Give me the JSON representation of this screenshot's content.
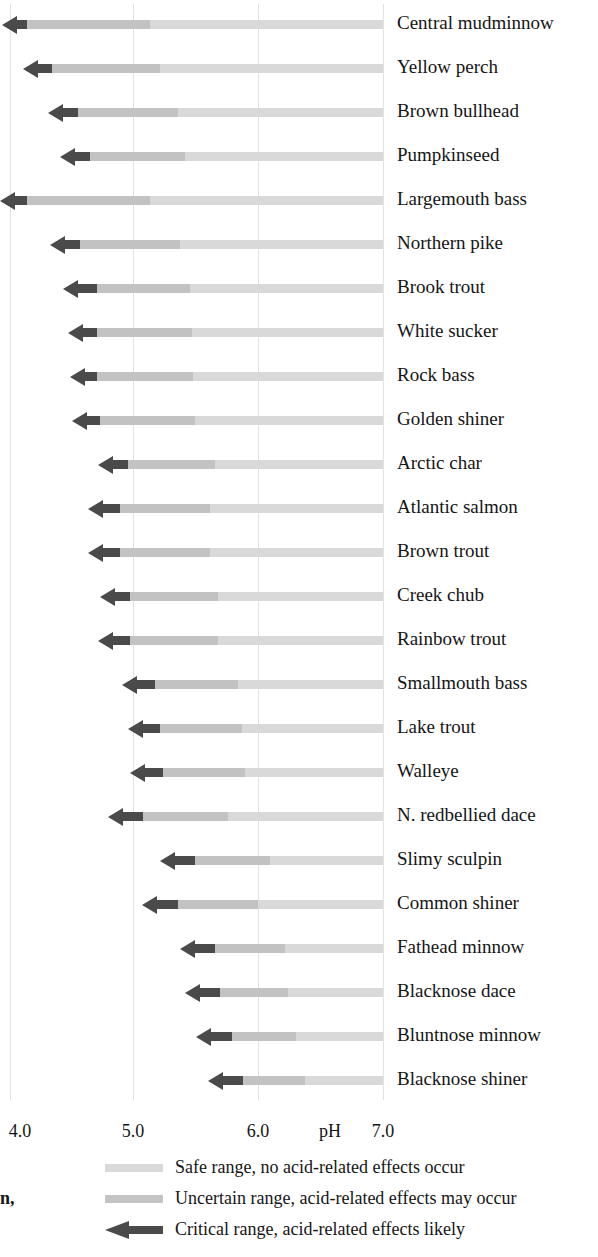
{
  "chart_data": {
    "type": "bar",
    "title": "",
    "xlabel": "pH",
    "ylabel": "",
    "xlim": [
      3.8,
      7.0
    ],
    "grid": true,
    "orientation": "horizontal",
    "legend_position": "bottom",
    "axis": {
      "ticks": [
        {
          "label": "4.0",
          "value": 4.0,
          "x": 20
        },
        {
          "label": "5.0",
          "value": 5.0,
          "x": 133
        },
        {
          "label": "6.0",
          "value": 6.0,
          "x": 258
        },
        {
          "label": "7.0",
          "value": 7.0,
          "x": 383
        }
      ],
      "title": "pH",
      "title_x": 330
    },
    "gridlines_x": [
      10,
      133,
      258,
      383
    ],
    "segments": [
      {
        "key": "critical",
        "label": "Critical range, acid-related effects likely",
        "color": "#4a4a4a"
      },
      {
        "key": "uncertain",
        "label": "Uncertain range, acid-related effects may occur",
        "color": "#c2c2c2"
      },
      {
        "key": "safe",
        "label": "Safe range, no acid-related effects occur",
        "color": "#d9d9d9"
      }
    ],
    "categories": [
      "Central mudminnow",
      "Yellow perch",
      "Brown bullhead",
      "Pumpkinseed",
      "Largemouth bass",
      "Northern pike",
      "Brook trout",
      "White sucker",
      "Rock bass",
      "Golden shiner",
      "Arctic char",
      "Atlantic salmon",
      "Brown trout",
      "Creek chub",
      "Rainbow trout",
      "Smallmouth bass",
      "Lake trout",
      "Walleye",
      "N. redbellied dace",
      "Slimy sculpin",
      "Common shiner",
      "Fathead minnow",
      "Blacknose dace",
      "Bluntnose minnow",
      "Blacknose shiner"
    ],
    "rows": [
      {
        "species": "Central mudminnow",
        "critical_start_px": 2,
        "critical_end_px": 27,
        "uncertain_end_px": 150,
        "safe_end_px": 383,
        "critical_ph_max": 4.2,
        "uncertain_ph_max": 5.1,
        "safe_ph_max": 7.0
      },
      {
        "species": "Yellow perch",
        "critical_start_px": 23,
        "critical_end_px": 52,
        "uncertain_end_px": 160,
        "safe_end_px": 383,
        "critical_ph_max": 4.4,
        "uncertain_ph_max": 5.2,
        "safe_ph_max": 7.0
      },
      {
        "species": "Brown bullhead",
        "critical_start_px": 48,
        "critical_end_px": 78,
        "uncertain_end_px": 178,
        "safe_end_px": 383,
        "critical_ph_max": 4.6,
        "uncertain_ph_max": 5.4,
        "safe_ph_max": 7.0
      },
      {
        "species": "Pumpkinseed",
        "critical_start_px": 60,
        "critical_end_px": 90,
        "uncertain_end_px": 185,
        "safe_end_px": 383,
        "critical_ph_max": 4.7,
        "uncertain_ph_max": 5.4,
        "safe_ph_max": 7.0
      },
      {
        "species": "Largemouth bass",
        "critical_start_px": 0,
        "critical_end_px": 27,
        "uncertain_end_px": 150,
        "safe_end_px": 383,
        "critical_ph_max": 4.2,
        "uncertain_ph_max": 5.1,
        "safe_ph_max": 7.0
      },
      {
        "species": "Northern pike",
        "critical_start_px": 50,
        "critical_end_px": 80,
        "uncertain_end_px": 180,
        "safe_end_px": 383,
        "critical_ph_max": 4.6,
        "uncertain_ph_max": 5.4,
        "safe_ph_max": 7.0
      },
      {
        "species": "Brook trout",
        "critical_start_px": 63,
        "critical_end_px": 97,
        "uncertain_end_px": 190,
        "safe_end_px": 383,
        "critical_ph_max": 4.8,
        "uncertain_ph_max": 5.5,
        "safe_ph_max": 7.0
      },
      {
        "species": "White sucker",
        "critical_start_px": 68,
        "critical_end_px": 97,
        "uncertain_end_px": 192,
        "safe_end_px": 383,
        "critical_ph_max": 4.8,
        "uncertain_ph_max": 5.5,
        "safe_ph_max": 7.0
      },
      {
        "species": "Rock bass",
        "critical_start_px": 70,
        "critical_end_px": 97,
        "uncertain_end_px": 193,
        "safe_end_px": 383,
        "critical_ph_max": 4.8,
        "uncertain_ph_max": 5.5,
        "safe_ph_max": 7.0
      },
      {
        "species": "Golden shiner",
        "critical_start_px": 72,
        "critical_end_px": 100,
        "uncertain_end_px": 195,
        "safe_end_px": 383,
        "critical_ph_max": 4.8,
        "uncertain_ph_max": 5.5,
        "safe_ph_max": 7.0
      },
      {
        "species": "Arctic char",
        "critical_start_px": 98,
        "critical_end_px": 128,
        "uncertain_end_px": 215,
        "safe_end_px": 383,
        "critical_ph_max": 5.0,
        "uncertain_ph_max": 5.7,
        "safe_ph_max": 7.0
      },
      {
        "species": "Atlantic salmon",
        "critical_start_px": 88,
        "critical_end_px": 120,
        "uncertain_end_px": 210,
        "safe_end_px": 383,
        "critical_ph_max": 4.9,
        "uncertain_ph_max": 5.6,
        "safe_ph_max": 7.0
      },
      {
        "species": "Brown trout",
        "critical_start_px": 88,
        "critical_end_px": 120,
        "uncertain_end_px": 210,
        "safe_end_px": 383,
        "critical_ph_max": 4.9,
        "uncertain_ph_max": 5.6,
        "safe_ph_max": 7.0
      },
      {
        "species": "Creek chub",
        "critical_start_px": 100,
        "critical_end_px": 130,
        "uncertain_end_px": 218,
        "safe_end_px": 383,
        "critical_ph_max": 5.0,
        "uncertain_ph_max": 5.7,
        "safe_ph_max": 7.0
      },
      {
        "species": "Rainbow trout",
        "critical_start_px": 98,
        "critical_end_px": 130,
        "uncertain_end_px": 218,
        "safe_end_px": 383,
        "critical_ph_max": 5.0,
        "uncertain_ph_max": 5.7,
        "safe_ph_max": 7.0
      },
      {
        "species": "Smallmouth bass",
        "critical_start_px": 122,
        "critical_end_px": 155,
        "uncertain_end_px": 238,
        "safe_end_px": 383,
        "critical_ph_max": 5.2,
        "uncertain_ph_max": 5.9,
        "safe_ph_max": 7.0
      },
      {
        "species": "Lake trout",
        "critical_start_px": 128,
        "critical_end_px": 160,
        "uncertain_end_px": 242,
        "safe_end_px": 383,
        "critical_ph_max": 5.2,
        "uncertain_ph_max": 5.9,
        "safe_ph_max": 7.0
      },
      {
        "species": "Walleye",
        "critical_start_px": 130,
        "critical_end_px": 163,
        "uncertain_end_px": 245,
        "safe_end_px": 383,
        "critical_ph_max": 5.3,
        "uncertain_ph_max": 5.9,
        "safe_ph_max": 7.0
      },
      {
        "species": "N. redbellied dace",
        "critical_start_px": 108,
        "critical_end_px": 143,
        "uncertain_end_px": 228,
        "safe_end_px": 383,
        "critical_ph_max": 5.1,
        "uncertain_ph_max": 5.8,
        "safe_ph_max": 7.0
      },
      {
        "species": "Slimy sculpin",
        "critical_start_px": 160,
        "critical_end_px": 195,
        "uncertain_end_px": 270,
        "safe_end_px": 383,
        "critical_ph_max": 5.5,
        "uncertain_ph_max": 6.1,
        "safe_ph_max": 7.0
      },
      {
        "species": "Common shiner",
        "critical_start_px": 142,
        "critical_end_px": 178,
        "uncertain_end_px": 258,
        "safe_end_px": 383,
        "critical_ph_max": 5.4,
        "uncertain_ph_max": 6.0,
        "safe_ph_max": 7.0
      },
      {
        "species": "Fathead minnow",
        "critical_start_px": 180,
        "critical_end_px": 215,
        "uncertain_end_px": 285,
        "safe_end_px": 383,
        "critical_ph_max": 5.7,
        "uncertain_ph_max": 6.2,
        "safe_ph_max": 7.0
      },
      {
        "species": "Blacknose dace",
        "critical_start_px": 185,
        "critical_end_px": 220,
        "uncertain_end_px": 288,
        "safe_end_px": 383,
        "critical_ph_max": 5.7,
        "uncertain_ph_max": 6.2,
        "safe_ph_max": 7.0
      },
      {
        "species": "Bluntnose minnow",
        "critical_start_px": 196,
        "critical_end_px": 232,
        "uncertain_end_px": 296,
        "safe_end_px": 383,
        "critical_ph_max": 5.8,
        "uncertain_ph_max": 6.3,
        "safe_ph_max": 7.0
      },
      {
        "species": "Blacknose shiner",
        "critical_start_px": 208,
        "critical_end_px": 243,
        "uncertain_end_px": 305,
        "safe_end_px": 383,
        "critical_ph_max": 5.9,
        "uncertain_ph_max": 6.4,
        "safe_ph_max": 7.0
      }
    ]
  },
  "legend": {
    "items": [
      {
        "name": "safe",
        "label": "Safe range, no acid-related effects occur"
      },
      {
        "name": "uncertain",
        "label": "Uncertain range, acid-related effects may occur"
      },
      {
        "name": "critical",
        "label": "Critical range, acid-related effects likely"
      }
    ]
  },
  "margin_fragment": "n,",
  "colors": {
    "safe": "#d9d9d9",
    "uncertain": "#c2c2c2",
    "critical": "#4a4a4a",
    "grid": "#e2e2e2",
    "text": "#151515",
    "background": "#ffffff"
  }
}
